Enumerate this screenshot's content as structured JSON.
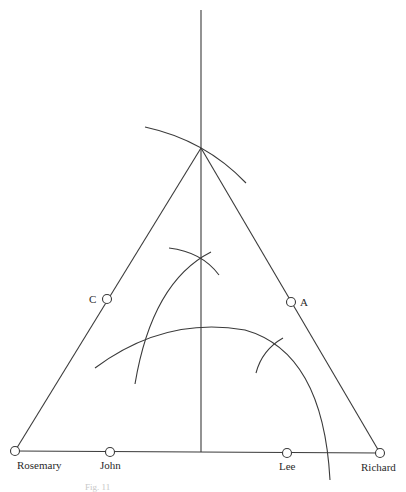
{
  "diagram": {
    "colors": {
      "stroke": "#3a3a3a",
      "label": "#2a2a2a",
      "background": "#ffffff",
      "caption": "#c8c8c8"
    },
    "points": {
      "rosemary": {
        "label": "Rosemary",
        "x": 15,
        "y": 451
      },
      "john": {
        "label": "John",
        "x": 110,
        "y": 452
      },
      "lee": {
        "label": "Lee",
        "x": 287,
        "y": 453
      },
      "richard": {
        "label": "Richard",
        "x": 380,
        "y": 453
      },
      "c": {
        "label": "C",
        "x": 107,
        "y": 299
      },
      "a": {
        "label": "A",
        "x": 291,
        "y": 302
      },
      "apex": {
        "x": 201,
        "y": 148
      }
    },
    "caption": "Fig. 11"
  }
}
